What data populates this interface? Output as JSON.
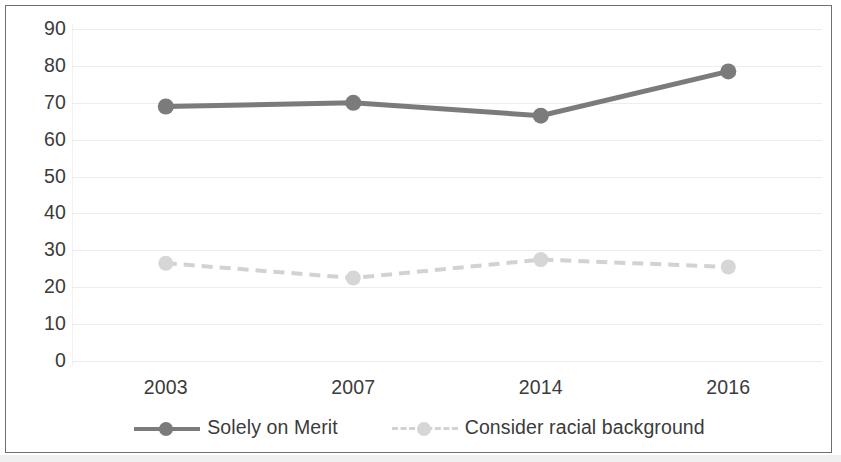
{
  "chart_data": {
    "type": "line",
    "title": "",
    "subtitle": "",
    "xlabel": "",
    "ylabel": "",
    "categories": [
      "2003",
      "2007",
      "2014",
      "2016"
    ],
    "ylim": [
      0,
      90
    ],
    "y_ticks": [
      0,
      10,
      20,
      30,
      40,
      50,
      60,
      70,
      80,
      90
    ],
    "y_tick_labels": [
      "0",
      "10",
      "20",
      "30",
      "40",
      "50",
      "60",
      "70",
      "80",
      "90"
    ],
    "grid": true,
    "legend_position": "bottom",
    "series": [
      {
        "name": "Solely on Merit",
        "values": [
          69,
          70,
          66.5,
          78.5
        ],
        "color": "#7b7b7b",
        "line_style": "solid",
        "marker": "circle"
      },
      {
        "name": "Consider racial background",
        "values": [
          26.5,
          22.5,
          27.5,
          25.5
        ],
        "color": "#d2d2d2",
        "line_style": "dashed",
        "marker": "circle"
      }
    ]
  },
  "legend": {
    "items": [
      {
        "label": "Solely on Merit",
        "swatch": "solid-line-with-dot-icon"
      },
      {
        "label": "Consider racial background",
        "swatch": "dashed-line-with-dot-icon"
      }
    ]
  },
  "colors": {
    "series_dark": "#7b7b7b",
    "series_light": "#d2d2d2",
    "text": "#3b3b3b",
    "gridline": "#ededed",
    "border": "#6f6f6f",
    "background": "#ffffff"
  }
}
